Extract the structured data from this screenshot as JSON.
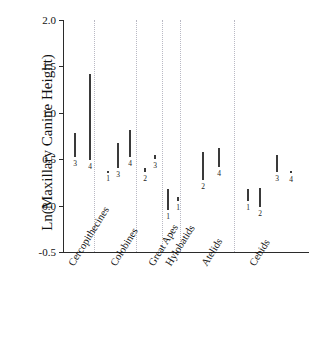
{
  "chart_data": {
    "type": "bar",
    "title": "",
    "xlabel": "",
    "ylabel": "Ln(Maxillary Canine Height)",
    "ylim": [
      -0.5,
      2.0
    ],
    "yticks": [
      2.0,
      1.5,
      1.0,
      0.5,
      0.0,
      -0.5
    ],
    "ytick_labels": [
      "2.0",
      "1.5",
      "1.0",
      "0.5",
      "0.0",
      "-0.5"
    ],
    "grid": false,
    "legend": "none",
    "orientation": "vertical-range-bars",
    "note": "Each vertical line is a range bar spanning min-max; the small number beneath each bar is its group-internal category code.",
    "categories": [
      "Cercopithecines",
      "Colobines",
      "Great Apes",
      "Hylobatids",
      "Atelids",
      "Cebids"
    ],
    "groups": [
      {
        "name": "Cercopithecines",
        "bars": [
          {
            "code": "3",
            "low": 0.52,
            "high": 0.78
          },
          {
            "code": "4",
            "low": 0.49,
            "high": 1.42
          }
        ]
      },
      {
        "name": "Colobines",
        "bars": [
          {
            "code": "1",
            "low": 0.36,
            "high": 0.37
          },
          {
            "code": "3",
            "low": 0.4,
            "high": 0.67
          },
          {
            "code": "4",
            "low": 0.52,
            "high": 0.81
          }
        ]
      },
      {
        "name": "Great Apes",
        "bars": [
          {
            "code": "2",
            "low": 0.36,
            "high": 0.4
          },
          {
            "code": "3",
            "low": 0.5,
            "high": 0.54
          }
        ]
      },
      {
        "name": "Hylobatids",
        "bars": [
          {
            "code": "1",
            "low": -0.05,
            "high": 0.18
          },
          {
            "code": "1",
            "low": 0.05,
            "high": 0.09
          }
        ]
      },
      {
        "name": "Atelids",
        "bars": [
          {
            "code": "2",
            "low": 0.28,
            "high": 0.58
          },
          {
            "code": "4",
            "low": 0.42,
            "high": 0.62
          }
        ]
      },
      {
        "name": "Cebids",
        "bars": [
          {
            "code": "1",
            "low": 0.05,
            "high": 0.18
          },
          {
            "code": "2",
            "low": -0.01,
            "high": 0.19
          },
          {
            "code": "3",
            "low": 0.36,
            "high": 0.55
          },
          {
            "code": "4",
            "low": 0.35,
            "high": 0.37
          }
        ]
      }
    ]
  },
  "axis": {
    "y_title": "Ln(Maxillary Canine Height)"
  }
}
